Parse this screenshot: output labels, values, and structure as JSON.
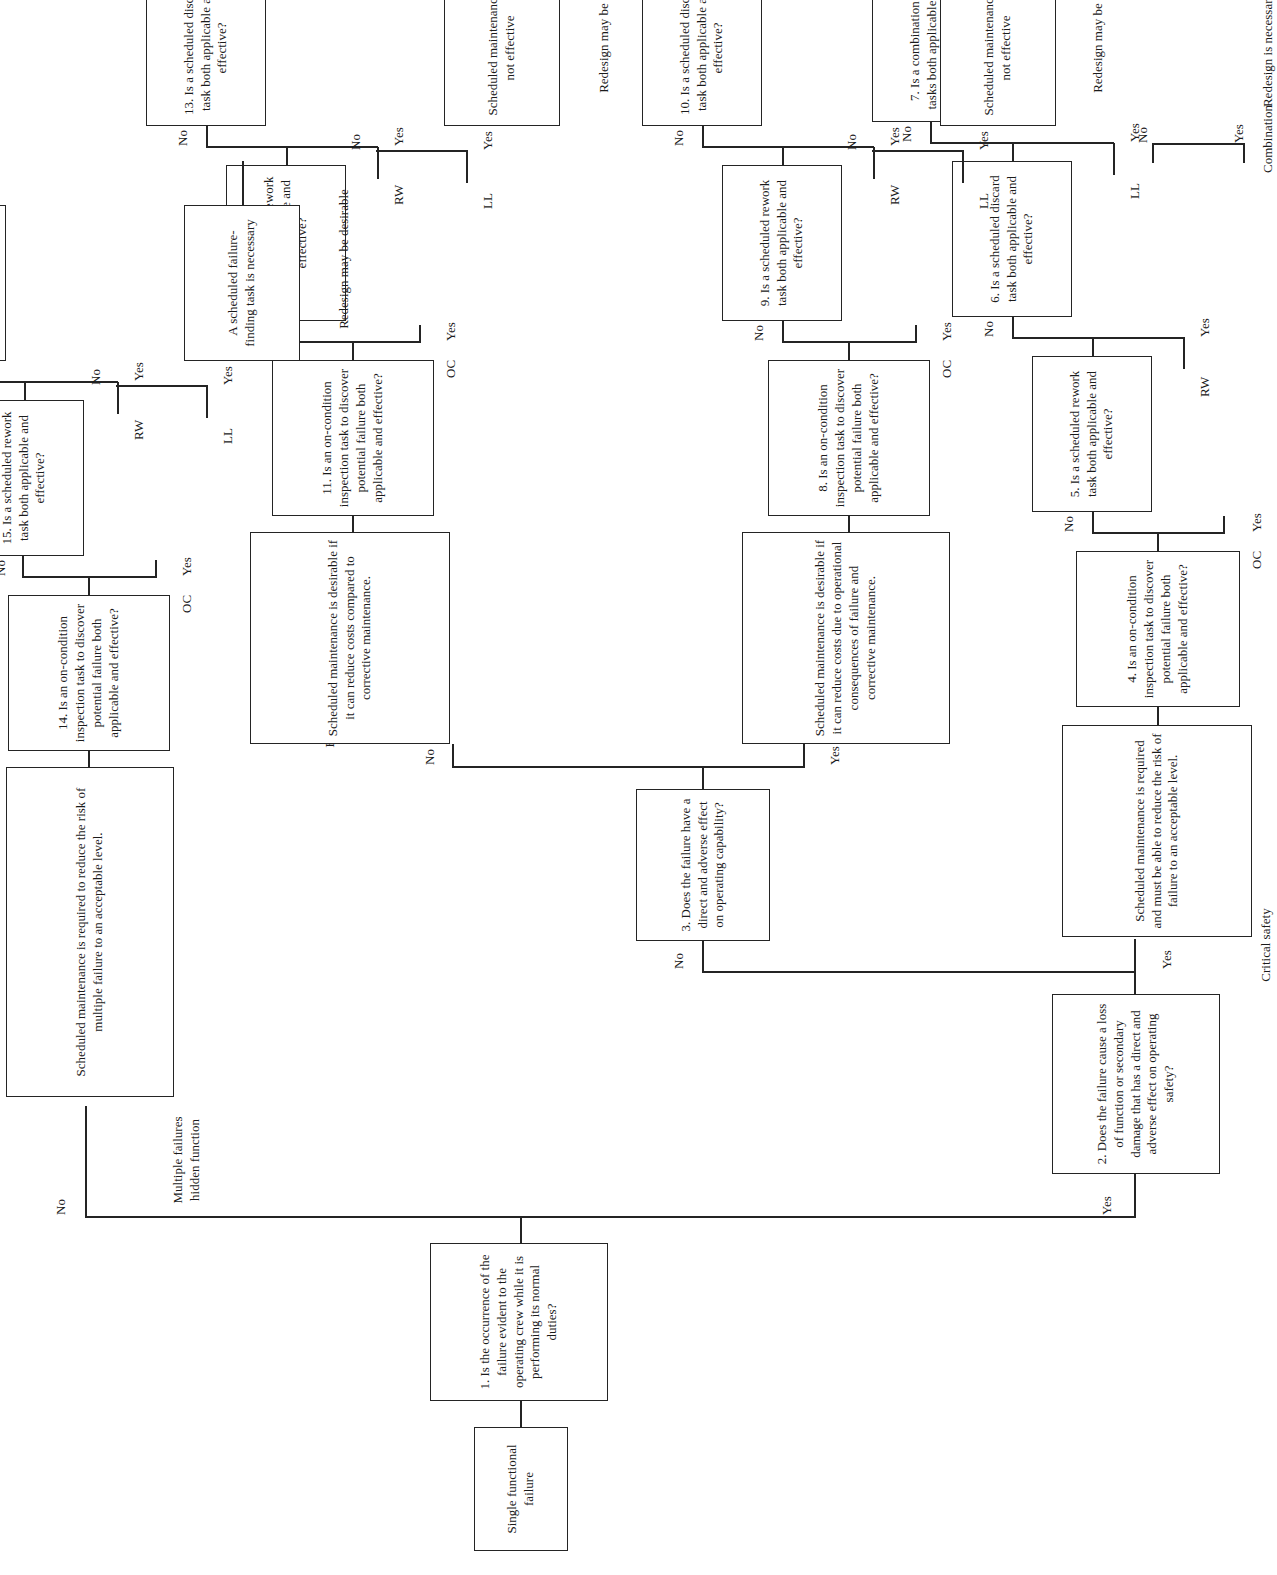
{
  "figure": {
    "caption": "FIGURE 3.3"
  },
  "nodes": {
    "start": "Single functional failure",
    "q1": "1. Is the occurrence of the failure evident to the operating crew while it is performing its normal duties?",
    "q2": "2. Does the failure cause a loss of function or secondary damage that has a direct and adverse effect on operating safety?",
    "q3": "3. Does the failure have a direct and adverse effect on operating capability?",
    "safety_statement": "Scheduled maintenance is required and must be able to reduce the risk of failure to an acceptable level.",
    "econ_op_statement": "Scheduled maintenance is desirable if it can reduce costs due to operational consequences of failure and corrective maintenance.",
    "econ_nonop_statement": "Scheduled maintenance is desirable if it can reduce costs compared to corrective maintenance.",
    "hidden_statement": "Scheduled maintenance is required to reduce the risk of multiple failure to an acceptable level.",
    "q4": "4. Is an on-condition inspection task to discover potential failure both applicable and effective?",
    "q5": "5. Is a scheduled rework task both applicable and effective?",
    "q6": "6. Is a scheduled discard task both applicable and effective?",
    "q7": "7.  Is a combination of tasks both applicable and effective?",
    "q8": "8. Is an on-condition inspection task to discover potential failure both applicable and effective?",
    "q9": "9. Is a scheduled rework task both applicable and effective?",
    "q10": "10. Is a scheduled discard task both applicable and effective?",
    "q11": "11. Is an on-condition inspection task to discover potential failure both applicable and effective?",
    "q12": "12. Is a scheduled rework task both applicable and effective?",
    "q13": "13. Is a scheduled discard task both applicable and effective?",
    "q14": "14. Is an on-condition inspection task to discover potential failure both applicable and effective?",
    "q15": "15. Is a scheduled rework task both applicable and effective?",
    "q16": "16. Is a scheduled discard task both applicable and effective?",
    "outcome_safety_ll": "Scheduled maintenance is not effective",
    "outcome_econop_ll": "Scheduled maintenance is not effective",
    "outcome_hidden_ll": "A scheduled failure-finding task is necessary"
  },
  "branch_labels": {
    "critical_safety": "Critical safety",
    "economic_operational": "Economic (operational)",
    "economic_non_operational": "Economic (non-operational)",
    "multiple_failures_hidden_function": "Multiple failures\nhidden function"
  },
  "outcomes": {
    "combination": "Combination",
    "redesign_necessary": "Redesign is necessary",
    "redesign_desirable_op": "Redesign may be desirable",
    "redesign_desirable_nonop": "Redesign may be desirable",
    "redesign_desirable_hidden": "Redesign may be desirable"
  },
  "edge_labels": {
    "yes": "Yes",
    "no": "No",
    "oc": "OC",
    "rw": "RW",
    "ll": "LL"
  }
}
